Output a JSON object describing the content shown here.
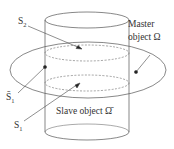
{
  "labels": {
    "s2": "S",
    "s2_sub": "2",
    "master_line1": "Master",
    "master_line2": "object Ω",
    "s1bar": "S̄",
    "s1bar_sub": "1",
    "slave": "Slave object Ω̄",
    "s1": "S",
    "s1_sub": "1"
  },
  "colors": {
    "stroke": "#555555",
    "dashed": "#666666",
    "text": "#333333",
    "background": "#ffffff"
  }
}
